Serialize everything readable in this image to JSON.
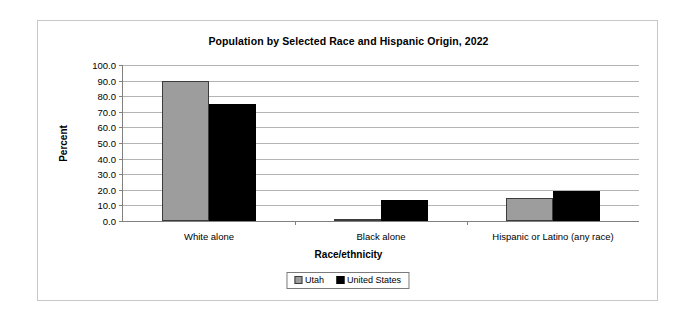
{
  "chart_data": {
    "type": "bar",
    "title": "Population by Selected Race and Hispanic Origin, 2022",
    "xlabel": "Race/ethnicity",
    "ylabel": "Percent",
    "categories": [
      "White alone",
      "Black alone",
      "Hispanic or Latino (any race)"
    ],
    "series": [
      {
        "name": "Utah",
        "color": "#9d9d9d",
        "values": [
          90.0,
          1.5,
          15.0
        ]
      },
      {
        "name": "United States",
        "color": "#000000",
        "values": [
          75.0,
          13.6,
          19.1
        ]
      }
    ],
    "ylim": [
      0,
      100
    ],
    "ytick_labels": [
      "100.0",
      "90.0",
      "80.0",
      "70.0",
      "60.0",
      "50.0",
      "40.0",
      "30.0",
      "20.0",
      "10.0",
      "0.0"
    ],
    "ytick_values": [
      100,
      90,
      80,
      70,
      60,
      50,
      40,
      30,
      20,
      10,
      0
    ],
    "grid": true,
    "legend_position": "bottom"
  }
}
